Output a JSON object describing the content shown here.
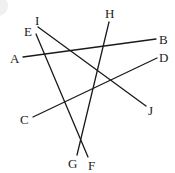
{
  "diagram": {
    "stroke_color": "#1a1a1a",
    "label_color": "#222222",
    "segments": [
      {
        "name": "AB",
        "from": "A",
        "to": "B",
        "x1": 23,
        "y1": 57,
        "x2": 156,
        "y2": 39
      },
      {
        "name": "CD",
        "from": "C",
        "to": "D",
        "x1": 33,
        "y1": 117,
        "x2": 157,
        "y2": 58
      },
      {
        "name": "EF",
        "from": "E",
        "to": "F",
        "x1": 36,
        "y1": 34,
        "x2": 88,
        "y2": 157
      },
      {
        "name": "GH",
        "from": "G",
        "to": "H",
        "x1": 77,
        "y1": 155,
        "x2": 109,
        "y2": 22
      },
      {
        "name": "IJ",
        "from": "I",
        "to": "J",
        "x1": 38,
        "y1": 27,
        "x2": 146,
        "y2": 106
      }
    ],
    "labels": {
      "A": {
        "text": "A",
        "x": 10,
        "y": 63
      },
      "B": {
        "text": "B",
        "x": 159,
        "y": 44
      },
      "C": {
        "text": "C",
        "x": 20,
        "y": 124
      },
      "D": {
        "text": "D",
        "x": 159,
        "y": 62
      },
      "E": {
        "text": "E",
        "x": 24,
        "y": 36
      },
      "F": {
        "text": "F",
        "x": 88,
        "y": 170
      },
      "G": {
        "text": "G",
        "x": 68,
        "y": 168
      },
      "H": {
        "text": "H",
        "x": 105,
        "y": 18
      },
      "I": {
        "text": "I",
        "x": 35,
        "y": 25
      },
      "J": {
        "text": "J",
        "x": 148,
        "y": 115
      }
    }
  }
}
